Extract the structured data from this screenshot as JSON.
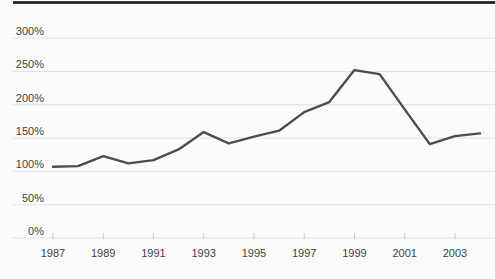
{
  "chart_data": {
    "type": "line",
    "title": "",
    "xlabel": "",
    "ylabel": "",
    "x": [
      1987,
      1988,
      1989,
      1990,
      1991,
      1992,
      1993,
      1994,
      1995,
      1996,
      1997,
      1998,
      1999,
      2000,
      2001,
      2002,
      2003,
      2004
    ],
    "series": [
      {
        "name": "percent-index-line",
        "values": [
          107,
          108,
          123,
          112,
          117,
          133,
          159,
          142,
          152,
          161,
          189,
          204,
          252,
          246,
          193,
          141,
          153,
          157
        ]
      }
    ],
    "y_ticks": [
      0,
      50,
      100,
      150,
      200,
      250,
      300
    ],
    "y_tick_labels": [
      "0%",
      "50%",
      "100%",
      "150%",
      "200%",
      "250%",
      "300%"
    ],
    "x_tick_years": [
      1987,
      1989,
      1991,
      1993,
      1995,
      1997,
      1999,
      2001,
      2003
    ],
    "x_tick_labels": [
      "1987",
      "1989",
      "1991",
      "1993",
      "1995",
      "1997",
      "1999",
      "2001",
      "2003"
    ],
    "ylim": [
      0,
      350
    ],
    "grid": "horizontal",
    "legend": "none",
    "colors": {
      "line": "#4d4d4d",
      "grid": "#e4e1e0",
      "tick": "#cfcccb",
      "label": "#3f3f3f",
      "top_border": "#161616",
      "background": "#fcfbfa"
    }
  }
}
